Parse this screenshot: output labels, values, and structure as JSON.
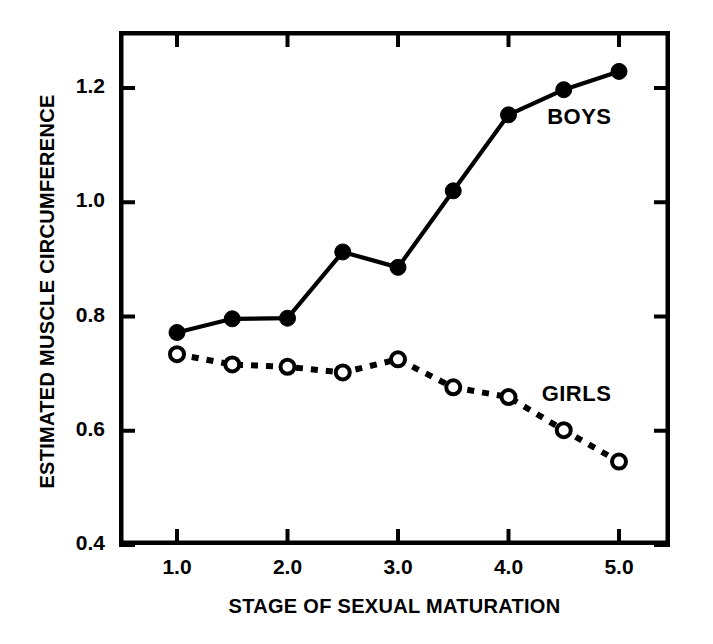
{
  "chart_data": {
    "type": "line",
    "title": "",
    "xlabel": "STAGE OF SEXUAL MATURATION",
    "ylabel": "ESTIMATED MUSCLE CIRCUMFERENCE",
    "x": [
      1.0,
      1.5,
      2.0,
      2.5,
      3.0,
      3.5,
      4.0,
      4.5,
      5.0
    ],
    "xlim": [
      0.75,
      5.25
    ],
    "ylim": [
      0.4,
      1.29
    ],
    "xticks": [
      1.0,
      2.0,
      3.0,
      4.0,
      5.0
    ],
    "xtick_labels": [
      "1.0",
      "2.0",
      "3.0",
      "4.0",
      "5.0"
    ],
    "xminorticks": [
      1.5,
      2.5,
      3.5,
      4.5
    ],
    "yticks": [
      0.4,
      0.6,
      0.8,
      1.0,
      1.2
    ],
    "ytick_labels": [
      "0.4",
      "0.6",
      "0.8",
      "1.0",
      "1.2"
    ],
    "grid": false,
    "legend_position": "inline-annotations",
    "series": [
      {
        "name": "BOYS",
        "marker": "filled-circle",
        "linestyle": "solid",
        "color": "#000000",
        "label_x": 4.35,
        "label_y": 1.145,
        "values": [
          0.772,
          0.796,
          0.797,
          0.913,
          0.886,
          1.02,
          1.153,
          1.197,
          1.229
        ]
      },
      {
        "name": "GIRLS",
        "marker": "open-circle",
        "linestyle": "dotted",
        "color": "#000000",
        "label_x": 4.3,
        "label_y": 0.66,
        "values": [
          0.734,
          0.716,
          0.712,
          0.702,
          0.725,
          0.676,
          0.659,
          0.601,
          0.546
        ]
      }
    ]
  },
  "axes": {
    "x_title": "STAGE OF SEXUAL MATURATION",
    "y_title": "ESTIMATED MUSCLE CIRCUMFERENCE"
  },
  "colors": {
    "ink": "#000000",
    "background": "#ffffff"
  }
}
